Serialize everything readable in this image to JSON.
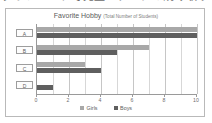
{
  "top_headline": "グラフ　これで完璧！データの読み取り・グラフ作成",
  "card": {
    "title": "Favorite Hobby",
    "subtitle": "(Total Number of Students)"
  },
  "legend": {
    "position": "bottom-center",
    "items": [
      {
        "label": "Girls",
        "color": "#a8a8a8",
        "icon": "legend-swatch"
      },
      {
        "label": "Boys",
        "color": "#5f5f5f",
        "icon": "legend-swatch"
      }
    ]
  },
  "chart_data": {
    "type": "bar",
    "orientation": "horizontal",
    "title": "Favorite Hobby (Total Number of Students)",
    "xlabel": "",
    "ylabel": "",
    "categories": [
      "A",
      "B",
      "C",
      "D"
    ],
    "series": [
      {
        "name": "Girls",
        "color": "#a8a8a8",
        "values": [
          10,
          7,
          3,
          0
        ]
      },
      {
        "name": "Boys",
        "color": "#5f5f5f",
        "values": [
          10,
          5,
          4,
          1
        ]
      }
    ],
    "xlim": [
      0,
      10
    ],
    "xticks": [
      0,
      2,
      4,
      6,
      8,
      10
    ],
    "xtick_labels": [
      "0",
      "2",
      "4",
      "6",
      "8",
      "10"
    ],
    "minor_gridlines": [
      1,
      3,
      5,
      7,
      9
    ],
    "grid": true,
    "legend_position": "bottom-center"
  }
}
